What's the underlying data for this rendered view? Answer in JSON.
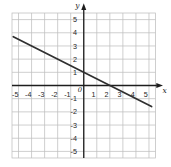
{
  "chart_data": {
    "type": "line",
    "title": "",
    "xlabel": "x",
    "ylabel": "y",
    "origin_label": "0",
    "xlim": [
      -5.5,
      5.5
    ],
    "ylim": [
      -5.5,
      5.5
    ],
    "grid": true,
    "xtick_values": [
      -5,
      -4,
      -3,
      -2,
      -1,
      1,
      2,
      3,
      4,
      5
    ],
    "xtick_labels": [
      "-5",
      "-4",
      "-3",
      "-2",
      "-1",
      "1",
      "2",
      "3",
      "4",
      "5"
    ],
    "ytick_values": [
      -5,
      -4,
      -3,
      -2,
      -1,
      1,
      2,
      3,
      4,
      5
    ],
    "ytick_labels": [
      "-5",
      "-4",
      "-3",
      "-2",
      "-1",
      "1",
      "2",
      "3",
      "4",
      "5"
    ],
    "series": [
      {
        "name": "plotted-line",
        "endpoints": [
          [
            -5.4,
            3.7
          ],
          [
            5.2,
            -1.6
          ]
        ],
        "slope": -0.5,
        "y_intercept": 1,
        "x_intercept": 2,
        "color": "#2f2f2f"
      }
    ],
    "colors": {
      "background": "#ffffff",
      "grid": "#bfbfbf",
      "axis": "#1d1d1d",
      "text": "#1d1d1d"
    }
  }
}
